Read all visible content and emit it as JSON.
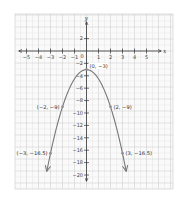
{
  "chart_data": {
    "type": "line",
    "title": "",
    "xlabel": "x",
    "ylabel": "y",
    "xlim": [
      -6,
      6
    ],
    "ylim": [
      -22,
      4
    ],
    "grid": true,
    "x_ticks": [
      -5,
      -4,
      -3,
      -2,
      -1,
      1,
      2,
      3,
      4,
      5
    ],
    "x_tick_labels": [
      "−5",
      "−4",
      "−3",
      "−2",
      "−1",
      "1",
      "2",
      "3",
      "4",
      "5"
    ],
    "y_ticks": [
      2,
      -2,
      -4,
      -6,
      -8,
      -10,
      -12,
      -14,
      -16,
      -18,
      -20
    ],
    "y_tick_labels": [
      "2",
      "−2",
      "−4",
      "−6",
      "−8",
      "−10",
      "−12",
      "−14",
      "−16",
      "−18",
      "−20"
    ],
    "origin_label": "0",
    "equation": "y = -1.5x^2 - 3",
    "series": [
      {
        "name": "parabola",
        "x": [
          -3.3,
          -3,
          -2,
          -1,
          0,
          1,
          2,
          3,
          3.3
        ],
        "values": [
          -19.3,
          -16.5,
          -9,
          -4.5,
          -3,
          -4.5,
          -9,
          -16.5,
          -19.3
        ]
      }
    ],
    "points": [
      {
        "x": 0,
        "y": -3,
        "label": "(0, −3)"
      },
      {
        "x": -2,
        "y": -9,
        "label": "(−2, −9)"
      },
      {
        "x": 2,
        "y": -9,
        "label": "(2, −9)"
      },
      {
        "x": -3,
        "y": -16.5,
        "label": "(−3, −16.5)"
      },
      {
        "x": 3,
        "y": -16.5,
        "label": "(3, −16.5)"
      }
    ],
    "colors": {
      "curve": "#777777",
      "axis": "#333333",
      "grid_minor": "#e4e4e4",
      "grid_major": "#c9c9c9",
      "point": "#8a8a8a"
    }
  }
}
